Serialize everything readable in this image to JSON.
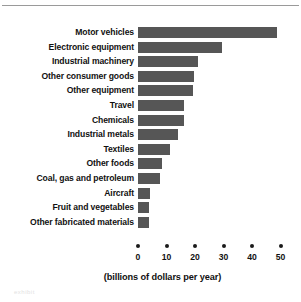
{
  "chart_data": {
    "type": "bar",
    "orientation": "horizontal",
    "title": "",
    "xlabel": "(billions of dollars per year)",
    "ylabel": "",
    "categories": [
      "Motor vehicles",
      "Electronic equipment",
      "Industrial machinery",
      "Other consumer goods",
      "Other equipment",
      "Travel",
      "Chemicals",
      "Industrial metals",
      "Textiles",
      "Other foods",
      "Coal, gas and petroleum",
      "Aircraft",
      "Fruit and vegetables",
      "Other fabricated materials"
    ],
    "values": [
      48.8,
      29.5,
      21.0,
      19.6,
      19.3,
      16.1,
      16.1,
      14.0,
      11.2,
      8.4,
      7.7,
      4.2,
      3.9,
      3.9
    ],
    "xticks": [
      0,
      10,
      20,
      30,
      40,
      50
    ],
    "xtick_labels": [
      "0",
      "10",
      "20",
      "30",
      "40",
      "50"
    ],
    "xlim": [
      0,
      50
    ],
    "grid": false,
    "legend": null,
    "bar_color": "#565656",
    "text_color": "#111111"
  },
  "figure": {
    "caption": "(billions of dollars per year)",
    "scan_artifact": "exhibit"
  }
}
